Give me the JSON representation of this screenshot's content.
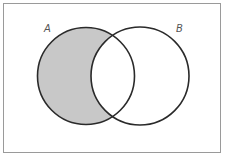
{
  "diagram": {
    "type": "venn",
    "shaded_region": "A minus B",
    "universe_frame": {
      "x": 3,
      "y": 3,
      "width": 217,
      "height": 149,
      "stroke": "#9a9a9a"
    },
    "sets": [
      {
        "label": "A",
        "cx": 86,
        "cy": 76,
        "r": 48.5
      },
      {
        "label": "B",
        "cx": 140,
        "cy": 76,
        "r": 49
      }
    ],
    "colors": {
      "fill": "#c8c8c8",
      "stroke": "#2a2a2a",
      "background": "#ffffff",
      "label": "#555555"
    }
  }
}
